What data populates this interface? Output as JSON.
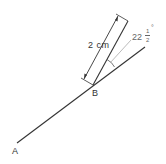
{
  "diagram": {
    "points": [
      {
        "name": "A",
        "label": "A"
      },
      {
        "name": "B",
        "label": "B"
      }
    ],
    "dimension_label": "2 cm",
    "angle_label": {
      "whole": "22",
      "fraction_numerator": "1",
      "fraction_denominator": "2",
      "degree": "°"
    },
    "colors": {
      "line": "#333333",
      "leader": "#aaaaaa",
      "background": "#ffffff"
    }
  }
}
